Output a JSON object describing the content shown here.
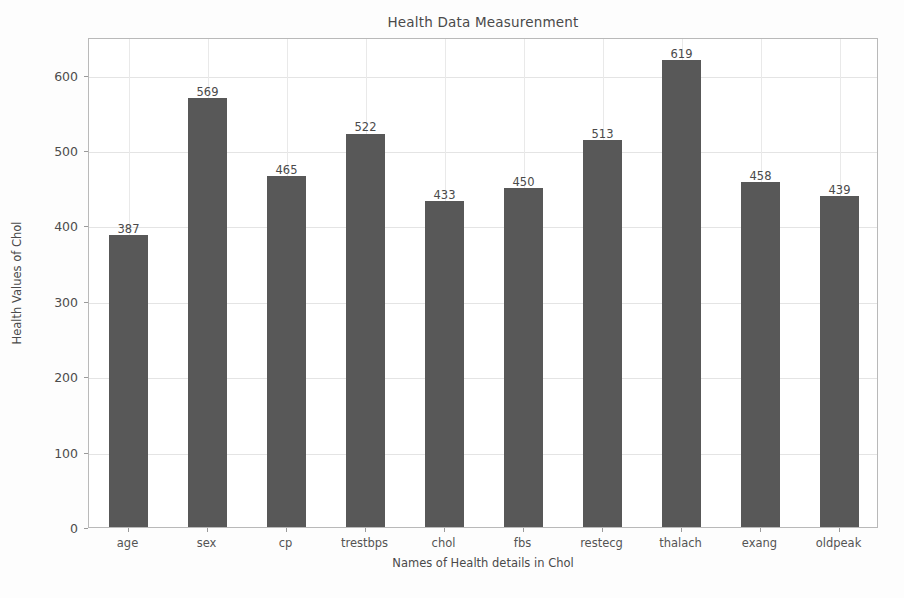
{
  "chart_data": {
    "type": "bar",
    "title": "Health Data Measurenment",
    "xlabel": "Names of Health details in Chol",
    "ylabel": "Health Values of Chol",
    "categories": [
      "age",
      "sex",
      "cp",
      "trestbps",
      "chol",
      "fbs",
      "restecg",
      "thalach",
      "exang",
      "oldpeak"
    ],
    "values": [
      387,
      569,
      465,
      522,
      433,
      450,
      513,
      619,
      458,
      439
    ],
    "value_labels": [
      "387",
      "569",
      "465",
      "522",
      "433",
      "450",
      "513",
      "619",
      "458",
      "439"
    ],
    "ylim": [
      0,
      650
    ],
    "yticks": [
      0,
      100,
      200,
      300,
      400,
      500,
      600
    ],
    "ytick_labels": [
      "0",
      "100",
      "200",
      "300",
      "400",
      "500",
      "600"
    ],
    "grid": true,
    "legend": "none",
    "bar_color": "#585858",
    "grid_color": "#e4e4e4",
    "axes_color": "#b9b9b9",
    "background_color": "#ffffff"
  }
}
